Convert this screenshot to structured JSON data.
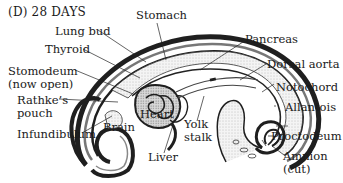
{
  "figure": {
    "title": "(D)  28 DAYS"
  },
  "labels": {
    "stomach": "Stomach",
    "lung_bud": "Lung bud",
    "pancreas": "Pancreas",
    "thyroid": "Thyroid",
    "dorsal_aorta": "Dorsal aorta",
    "stomodeum_1": "Stomodeum",
    "stomodeum_2": "(now open)",
    "notochord": "Notochord",
    "rathkes_1": "Rathke’s",
    "rathkes_2": "pouch",
    "heart": "Heart",
    "allantois": "Allantois",
    "brain": "Brain",
    "yolk_1": "Yolk",
    "yolk_2": "stalk",
    "infundibulum": "Infundibulum",
    "proctodeum": "Proctodeum",
    "liver": "Liver",
    "amnion_1": "Amnion",
    "amnion_2": "(cut)"
  }
}
